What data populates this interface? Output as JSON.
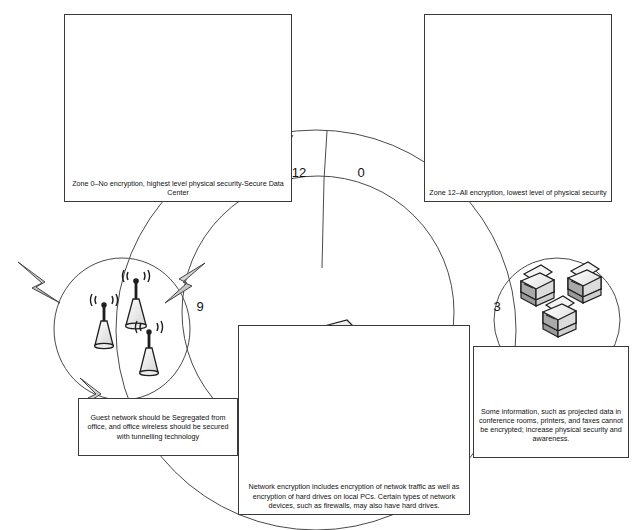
{
  "diagram": {
    "zone_numbers": [
      {
        "name": "zone-12",
        "value": "12",
        "x": 295,
        "y": 165
      },
      {
        "name": "zone-0",
        "value": "0",
        "x": 358,
        "y": 165
      },
      {
        "name": "zone-9",
        "value": "9",
        "x": 197,
        "y": 300
      },
      {
        "name": "zone-3",
        "value": "3",
        "x": 494,
        "y": 300
      }
    ],
    "callouts": [
      {
        "name": "callout-zone-0",
        "caption": "Zone 0–No encryption, highest level physical security-Secure Data Center",
        "devices": [
          "camera-icon",
          "pda-phone-icon",
          "flip-phone-icon",
          "tablet-stylus-icon",
          "laptop-icon"
        ]
      },
      {
        "name": "callout-zone-12",
        "caption": "Zone 12–All encryption, lowest level of physical security",
        "devices": [
          "server-tower-icon",
          "server-tower-icon",
          "server-tower-icon"
        ]
      },
      {
        "name": "callout-guest-network",
        "caption": "Guest network should be Segregated from office, and office wireless should be secured with tunnelling technology",
        "devices": [
          "wireless-access-point-icon",
          "wireless-access-point-icon",
          "wireless-access-point-icon",
          "lightning-bolt-icon",
          "lightning-bolt-icon",
          "lightning-bolt-icon"
        ]
      },
      {
        "name": "callout-network-encryption",
        "caption": "Network encryption includes encryption of netwok traffic as well as encryption of hard drives on local PCs. Certain types of network devices, such as firewalls, may also have hard drives.",
        "devices": [
          "desktop-pc-icon",
          "desktop-pc-icon",
          "desktop-pc-icon",
          "network-switch-icon",
          "server-rack-icon"
        ]
      },
      {
        "name": "callout-projected-data",
        "caption": "Some information, such as projected data in conference rooms, printers, and faxes cannot be encrypted; increase physical security and awareness.",
        "devices": [
          "printer-icon",
          "printer-icon",
          "printer-icon",
          "projector-screen-icon",
          "projector-screen-icon",
          "projector-screen-icon"
        ]
      }
    ],
    "colors": {
      "stroke": "#3a3a3a",
      "text": "#111111",
      "background": "#ffffff",
      "icon_fill_light": "#f0f0f0",
      "icon_fill_mid": "#c9c9c9",
      "icon_fill_dark": "#8f8f8f"
    }
  }
}
